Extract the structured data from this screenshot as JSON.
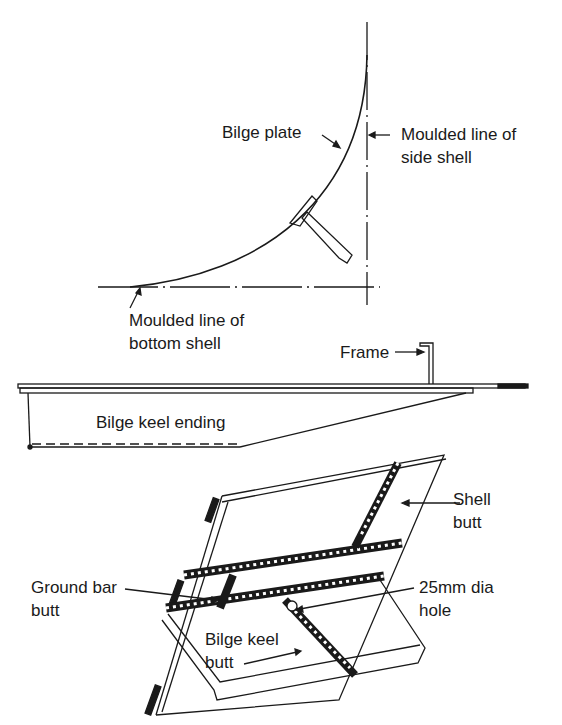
{
  "figure": {
    "panels": [
      {
        "id": "bilge-section",
        "description": "Cross-section of bilge plate with moulded lines"
      },
      {
        "id": "bilge-keel-ending",
        "description": "Side elevation of bilge keel ending"
      },
      {
        "id": "bilge-keel-butts",
        "description": "Isometric view of shell and bilge keel butts"
      }
    ]
  },
  "labels": {
    "bilge_plate": "Bilge plate",
    "side_shell_line1": "Moulded line of",
    "side_shell_line2": "side shell",
    "bottom_shell_line1": "Moulded line of",
    "bottom_shell_line2": "bottom shell",
    "frame": "Frame",
    "bilge_keel_ending": "Bilge keel ending",
    "shell_butt_line1": "Shell",
    "shell_butt_line2": "butt",
    "ground_bar_line1": "Ground bar",
    "ground_bar_line2": "butt",
    "hole_line1": "25mm dia",
    "hole_line2": "hole",
    "bilge_keel_butt_line1": "Bilge keel",
    "bilge_keel_butt_line2": "butt"
  },
  "colors": {
    "ink": "#1a1a1a",
    "background": "#ffffff"
  }
}
